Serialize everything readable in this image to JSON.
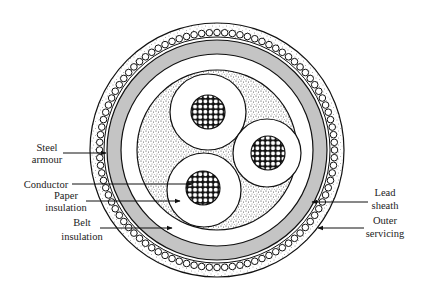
{
  "diagram": {
    "colors": {
      "background": "#ffffff",
      "outline": "#111111",
      "lead_sheath": "#c4c4c4",
      "speckle": "#555555"
    },
    "labels": {
      "steel_armour": [
        "Steel",
        "armour"
      ],
      "conductor": [
        "Conductor"
      ],
      "paper_insulation": [
        "Paper",
        "insulation"
      ],
      "belt_insulation": [
        "Belt",
        "insulation"
      ],
      "lead_sheath": [
        "Lead",
        "sheath"
      ],
      "outer_servicing": [
        "Outer",
        "servicing"
      ]
    },
    "geometry": {
      "center": [
        217,
        150
      ],
      "outer_radius": 127,
      "armour_radius": 118,
      "lead_sheath_outer": 110,
      "lead_sheath_inner": 96,
      "belt_inner": 80,
      "cores": [
        {
          "cx": 208,
          "cy": 112,
          "r": 38,
          "conductor_r": 17
        },
        {
          "cx": 267,
          "cy": 153,
          "r": 34,
          "conductor_r": 17
        },
        {
          "cx": 204,
          "cy": 190,
          "r": 37,
          "conductor_r": 17
        }
      ]
    }
  }
}
